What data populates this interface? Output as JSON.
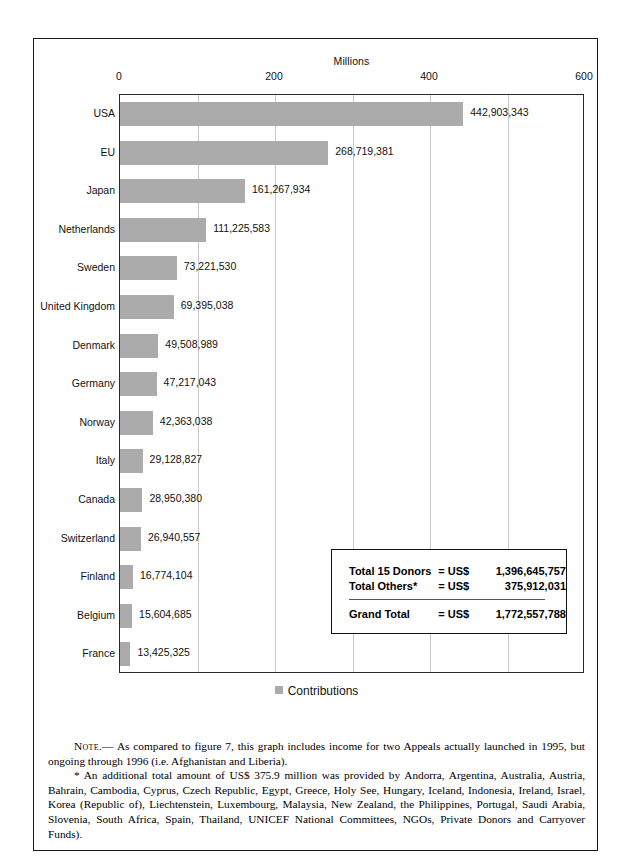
{
  "chart_data": {
    "type": "bar",
    "orientation": "horizontal",
    "title": "",
    "xlabel": "Millions",
    "ylabel": "",
    "xlim": [
      0,
      600
    ],
    "xticks": [
      0,
      200,
      400,
      600
    ],
    "gridlines": [
      100,
      200,
      300,
      400,
      500
    ],
    "grid": true,
    "legend": [
      "Contributions"
    ],
    "legend_position": "bottom-center",
    "bar_color": "#ababab",
    "categories": [
      "USA",
      "EU",
      "Japan",
      "Netherlands",
      "Sweden",
      "United Kingdom",
      "Denmark",
      "Germany",
      "Norway",
      "Italy",
      "Canada",
      "Switzerland",
      "Finland",
      "Belgium",
      "France"
    ],
    "values": [
      442903343,
      268719381,
      161267934,
      111225583,
      73221530,
      69395038,
      49508989,
      47217043,
      42363038,
      29128827,
      28950380,
      26940557,
      16774104,
      15604685,
      13425325
    ],
    "value_labels": [
      "442,903,343",
      "268,719,381",
      "161,267,934",
      "111,225,583",
      "73,221,530",
      "69,395,038",
      "49,508,989",
      "47,217,043",
      "42,363,038",
      "29,128,827",
      "28,950,380",
      "26,940,557",
      "16,774,104",
      "15,604,685",
      "13,425,325"
    ]
  },
  "axis": {
    "title": "Millions",
    "ticks": [
      "0",
      "200",
      "400",
      "600"
    ]
  },
  "legend": {
    "label": "Contributions"
  },
  "totals": {
    "row1": {
      "label": "Total 15 Donors",
      "eq": "= US$",
      "value": "1,396,645,757"
    },
    "row2": {
      "label": "Total Others*",
      "eq": "= US$",
      "value": "375,912,031"
    },
    "row3": {
      "label": "Grand Total",
      "eq": "= US$",
      "value": "1,772,557,788"
    }
  },
  "note": {
    "lead": "Note.—",
    "paragraph1": " As compared to figure 7, this graph includes income for two Appeals actually launched in 1995, but ongoing through 1996 (i.e. Afghanistan and Liberia).",
    "paragraph2": "* An additional total amount of US$ 375.9 million was provided by Andorra, Argentina, Australia, Austria, Bahrain, Cambodia, Cyprus, Czech Republic, Egypt, Greece, Holy See, Hungary, Iceland, Indonesia, Ireland, Israel, Korea (Republic of), Liechtenstein, Luxembourg, Malaysia, New Zealand, the Philippines, Portugal, Saudi Arabia, Slovenia, South Africa, Spain, Thailand, UNICEF National Committees, NGOs, Private Donors and Carryover Funds)."
  }
}
